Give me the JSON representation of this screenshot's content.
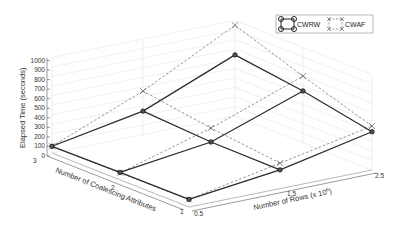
{
  "chart_data": {
    "type": "line",
    "subtype": "3d-mesh",
    "title": "",
    "xlabel": "Number of Rows (x 10^6)",
    "ylabel": "Number of Coalescing Attributes",
    "zlabel": "Elapsed Time (seconds)",
    "x_ticks": [
      "0.5",
      "1.5",
      "2.5"
    ],
    "y_ticks": [
      "1",
      "2",
      "3"
    ],
    "z_ticks": [
      "0",
      "100",
      "200",
      "300",
      "400",
      "500",
      "600",
      "700",
      "800",
      "900",
      "1000"
    ],
    "zlim": [
      0,
      1000
    ],
    "grid": true,
    "legend_position": "top-right",
    "x": [
      0.5,
      1.5,
      2.5
    ],
    "y": [
      1,
      2,
      3
    ],
    "series": [
      {
        "name": "CWRW",
        "style": "solid line, circle markers",
        "values_by_attr": {
          "1": [
            80,
            190,
            400
          ],
          "2": [
            80,
            210,
            545
          ],
          "3": [
            70,
            250,
            640
          ]
        }
      },
      {
        "name": "CWAF",
        "style": "dashed line, x markers",
        "values_by_attr": {
          "1": [
            80,
            260,
            460
          ],
          "2": [
            75,
            355,
            700
          ],
          "3": [
            70,
            460,
            950
          ]
        }
      }
    ]
  },
  "legend": {
    "items": [
      {
        "label": "CWRW"
      },
      {
        "label": "CWAF"
      }
    ]
  },
  "axes": {
    "z_label": "Elapsed Time (seconds)",
    "y_label": "Number of Coalescing Attributes",
    "x_label_main": "Number of Rows (x 10",
    "x_label_exp": "6",
    "x_label_close": ")",
    "z_ticks": [
      "0",
      "100",
      "200",
      "300",
      "400",
      "500",
      "600",
      "700",
      "800",
      "900",
      "1000"
    ],
    "y_ticks": [
      "3",
      "2",
      "1"
    ],
    "x_ticks": [
      "0.5",
      "1.5",
      "2.5"
    ]
  }
}
